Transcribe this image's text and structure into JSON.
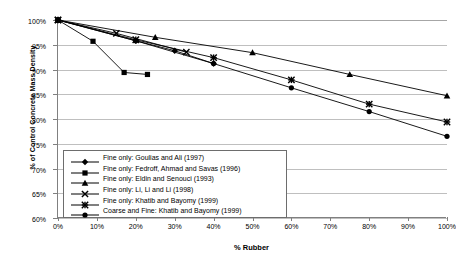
{
  "chart_data": {
    "type": "line",
    "title": "",
    "xlabel": "% Rubber",
    "ylabel": "% of Control Concrete Mass Density",
    "xlim": [
      0,
      100
    ],
    "ylim": [
      60,
      100
    ],
    "grid": true,
    "legend_position": "inside-bottom-left",
    "xticks": [
      "0%",
      "10%",
      "20%",
      "30%",
      "40%",
      "50%",
      "60%",
      "70%",
      "80%",
      "90%",
      "100%"
    ],
    "xtick_values": [
      0,
      10,
      20,
      30,
      40,
      50,
      60,
      70,
      80,
      90,
      100
    ],
    "yticks": [
      "60%",
      "65%",
      "70%",
      "75%",
      "80%",
      "85%",
      "90%",
      "95%",
      "100%"
    ],
    "ytick_values": [
      60,
      65,
      70,
      75,
      80,
      85,
      90,
      95,
      100
    ],
    "series": [
      {
        "name": "Fine only: Goulias and Ali (1997)",
        "marker": "diamond",
        "x": [
          0,
          20,
          30,
          40
        ],
        "y": [
          100.0,
          95.8,
          93.8,
          91.2
        ]
      },
      {
        "name": "Fine only: Fedroff, Ahmad and Savas (1996)",
        "marker": "square",
        "x": [
          0,
          9,
          17,
          23
        ],
        "y": [
          100.0,
          95.7,
          89.4,
          89.0
        ]
      },
      {
        "name": "Fine only: Eldin and Senouci (1993)",
        "marker": "triangle",
        "x": [
          0,
          25,
          50,
          75,
          100
        ],
        "y": [
          100.0,
          96.5,
          93.4,
          89.0,
          84.7
        ]
      },
      {
        "name": "Fine only: Li, Li and Li (1998)",
        "marker": "cross",
        "x": [
          0,
          15,
          33
        ],
        "y": [
          100.0,
          97.3,
          93.5
        ]
      },
      {
        "name": "Fine only: Khatib and Bayomy (1999)",
        "marker": "star",
        "x": [
          0,
          20,
          40,
          60,
          80,
          100
        ],
        "y": [
          100.0,
          96.0,
          92.4,
          87.9,
          83.0,
          79.4
        ]
      },
      {
        "name": "Coarse and Fine: Khatib and Bayomy (1999)",
        "marker": "circle",
        "x": [
          0,
          20,
          40,
          60,
          80,
          100
        ],
        "y": [
          100.0,
          95.8,
          91.2,
          86.3,
          81.5,
          76.5
        ]
      }
    ],
    "colors": {
      "line": "#000000",
      "marker": "#000000",
      "gridline": "#bfbfbf",
      "axis": "#808080",
      "background": "#ffffff"
    }
  }
}
